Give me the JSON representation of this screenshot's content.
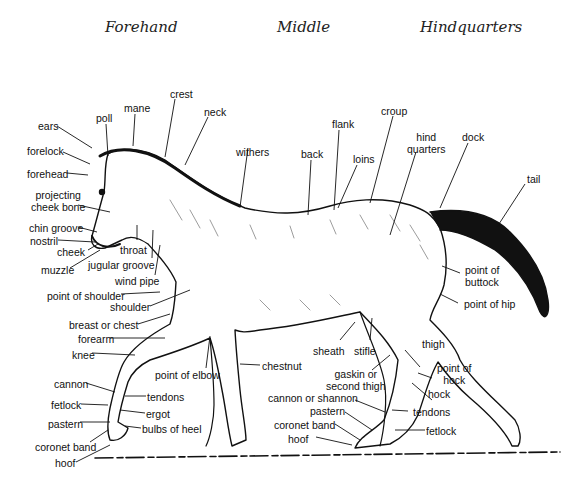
{
  "regions": {
    "forehand": "Forehand",
    "middle": "Middle",
    "hindquarters": "Hindquarters"
  },
  "labels": {
    "poll": "poll",
    "mane": "mane",
    "crest": "crest",
    "neck": "neck",
    "ears": "ears",
    "forelock": "forelock",
    "forehead": "forehead",
    "projecting_cheek_bone_1": "projecting",
    "projecting_cheek_bone_2": "cheek bone",
    "chin_groove": "chin groove",
    "nostril": "nostril",
    "cheek": "cheek",
    "muzzle": "muzzle",
    "throat": "throat",
    "jugular_groove": "jugular groove",
    "wind_pipe": "wind pipe",
    "point_of_shoulder": "point of shoulder",
    "shoulder": "shoulder",
    "breast_or_chest": "breast or chest",
    "forearm": "forearm",
    "knee": "knee",
    "cannon": "cannon",
    "fetlock": "fetlock",
    "pastern": "pastern",
    "coronet_band": "coronet band",
    "hoof": "hoof",
    "tendons": "tendons",
    "ergot": "ergot",
    "bulbs_of_heel": "bulbs of heel",
    "point_of_elbow": "point of elbow",
    "chestnut": "chestnut",
    "withers": "withers",
    "back": "back",
    "flank": "flank",
    "loins": "loins",
    "croup": "croup",
    "hind_quarters_1": "hind",
    "hind_quarters_2": "quarters",
    "dock": "dock",
    "tail": "tail",
    "point_of_buttock_1": "point of",
    "point_of_buttock_2": "buttock",
    "point_of_hip": "point of hip",
    "thigh": "thigh",
    "sheath": "sheath",
    "stifle": "stifle",
    "gaskin_1": "gaskin or",
    "gaskin_2": "second thigh",
    "point_of_hock_1": "point of",
    "point_of_hock_2": "hock",
    "hock": "hock",
    "cannon_or_shannon": "cannon or shannon",
    "hind_pastern": "pastern",
    "hind_coronet_band": "coronet band",
    "hind_hoof": "hoof",
    "hind_tendons": "tendons",
    "hind_fetlock": "fetlock"
  },
  "colors": {
    "ink": "#111111",
    "background": "#ffffff"
  }
}
